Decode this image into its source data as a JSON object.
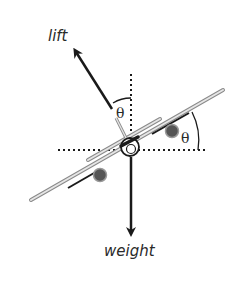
{
  "diagram": {
    "labels": {
      "lift": "lift",
      "weight": "weight",
      "theta_top": "θ",
      "theta_right": "θ"
    },
    "colors": {
      "ink": "#1a1a1a",
      "wing_fill": "#e6e6e6",
      "wing_stroke": "#8a8a8a",
      "engine_fill": "#555555",
      "background": "#ffffff"
    },
    "forces": [
      {
        "name": "lift",
        "direction": "perpendicular to wings, tilted by θ from vertical"
      },
      {
        "name": "weight",
        "direction": "straight down"
      }
    ],
    "angles": [
      {
        "symbol": "θ",
        "between": "lift vector and vertical"
      },
      {
        "symbol": "θ",
        "between": "wing and horizontal"
      }
    ]
  }
}
